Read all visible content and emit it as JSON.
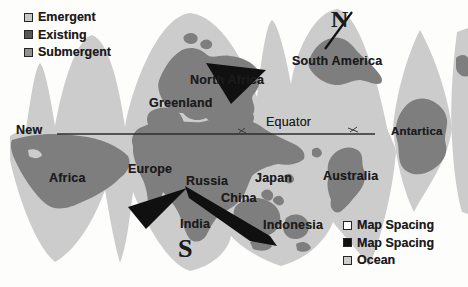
{
  "colors": {
    "background": "#fdfdfc",
    "ocean": "#cccccc",
    "land": "#7e7e7e",
    "spacing_black": "#101010",
    "spacing_white": "#ffffff",
    "text": "#1c1c1c",
    "equator_line": "#2e2e2e",
    "legend_emergent": "#c7c7c7",
    "legend_existing": "#575757",
    "legend_submergent": "#929292"
  },
  "legend_top": {
    "items": [
      {
        "label": "Emergent"
      },
      {
        "label": "Existing"
      },
      {
        "label": "Submergent"
      }
    ]
  },
  "legend_bottom": {
    "items": [
      {
        "label": "Map Spacing"
      },
      {
        "label": "Map Spacing"
      },
      {
        "label": "Ocean"
      }
    ]
  },
  "compass": {
    "north": "N",
    "south": "S"
  },
  "map": {
    "equator_label": "Equator",
    "labels": [
      {
        "name": "label-greenland",
        "text": "Greenland",
        "x": 149,
        "y": 97,
        "size": 12.5,
        "weight": 700,
        "font": "sans"
      },
      {
        "name": "label-north-africa",
        "text": "North Africa",
        "x": 190,
        "y": 74,
        "size": 12.5,
        "weight": 700,
        "font": "sans"
      },
      {
        "name": "label-south-america",
        "text": "South America",
        "x": 292,
        "y": 55,
        "size": 12.5,
        "weight": 700,
        "font": "sans"
      },
      {
        "name": "label-new",
        "text": "New",
        "x": 16,
        "y": 124,
        "size": 12.5,
        "weight": 700,
        "font": "sans"
      },
      {
        "name": "label-equator",
        "text": "Equator",
        "x": 266,
        "y": 116,
        "size": 12.5,
        "weight": 400,
        "font": "sans"
      },
      {
        "name": "label-antartica",
        "text": "Antartica",
        "x": 391,
        "y": 126,
        "size": 11.5,
        "weight": 700,
        "font": "sans"
      },
      {
        "name": "label-africa",
        "text": "Africa",
        "x": 49,
        "y": 172,
        "size": 12.5,
        "weight": 700,
        "font": "sans"
      },
      {
        "name": "label-europe",
        "text": "Europe",
        "x": 128,
        "y": 163,
        "size": 12.5,
        "weight": 700,
        "font": "sans"
      },
      {
        "name": "label-russia",
        "text": "Russia",
        "x": 186,
        "y": 175,
        "size": 12.5,
        "weight": 700,
        "font": "sans"
      },
      {
        "name": "label-china",
        "text": "China",
        "x": 221,
        "y": 192,
        "size": 12.5,
        "weight": 700,
        "font": "sans"
      },
      {
        "name": "label-japan",
        "text": "Japan",
        "x": 255,
        "y": 172,
        "size": 12.5,
        "weight": 700,
        "font": "sans"
      },
      {
        "name": "label-australia",
        "text": "Australia",
        "x": 323,
        "y": 170,
        "size": 12.5,
        "weight": 700,
        "font": "sans"
      },
      {
        "name": "label-india",
        "text": "India",
        "x": 180,
        "y": 218,
        "size": 12.5,
        "weight": 700,
        "font": "sans"
      },
      {
        "name": "label-indonesia",
        "text": "Indonesia",
        "x": 263,
        "y": 219,
        "size": 12.5,
        "weight": 700,
        "font": "sans"
      },
      {
        "name": "compass-n",
        "text": "N",
        "x": 331,
        "y": 7,
        "size": 24,
        "weight": 700,
        "font": "serif"
      },
      {
        "name": "compass-s",
        "text": "S",
        "x": 178,
        "y": 236,
        "size": 26,
        "weight": 700,
        "font": "serif"
      }
    ]
  }
}
